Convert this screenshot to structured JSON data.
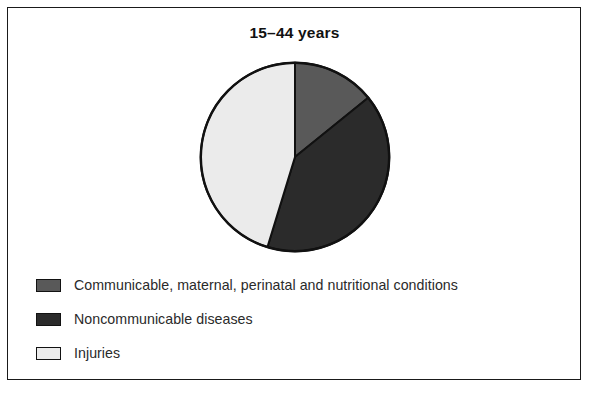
{
  "figure": {
    "title": "15–44 years",
    "frame_border_color": "#1a1a1a",
    "background_color": "#ffffff"
  },
  "legend": {
    "items": [
      {
        "label": "Communicable, maternal, perinatal and nutritional conditions",
        "swatch_name": "legend-swatch-communicable",
        "color": "#595959"
      },
      {
        "label": "Noncommunicable diseases",
        "swatch_name": "legend-swatch-noncommunicable",
        "color": "#2b2b2b"
      },
      {
        "label": "Injuries",
        "swatch_name": "legend-swatch-injuries",
        "color": "#ebebeb"
      }
    ]
  },
  "chart_data": {
    "type": "pie",
    "title": "15–44 years",
    "xlabel": "",
    "ylabel": "",
    "categories": [
      "Communicable, maternal, perinatal and nutritional conditions",
      "Noncommunicable diseases",
      "Injuries"
    ],
    "values": [
      14,
      41,
      45
    ],
    "unit": "percent",
    "angles_deg": [
      51,
      146,
      163
    ],
    "colors": [
      "#595959",
      "#2b2b2b",
      "#ebebeb"
    ],
    "start_angle_deg": 0,
    "direction": "clockwise",
    "slice_border_color": "#111111",
    "legend_position": "bottom-left",
    "grid": false,
    "data_labels_shown": false
  }
}
